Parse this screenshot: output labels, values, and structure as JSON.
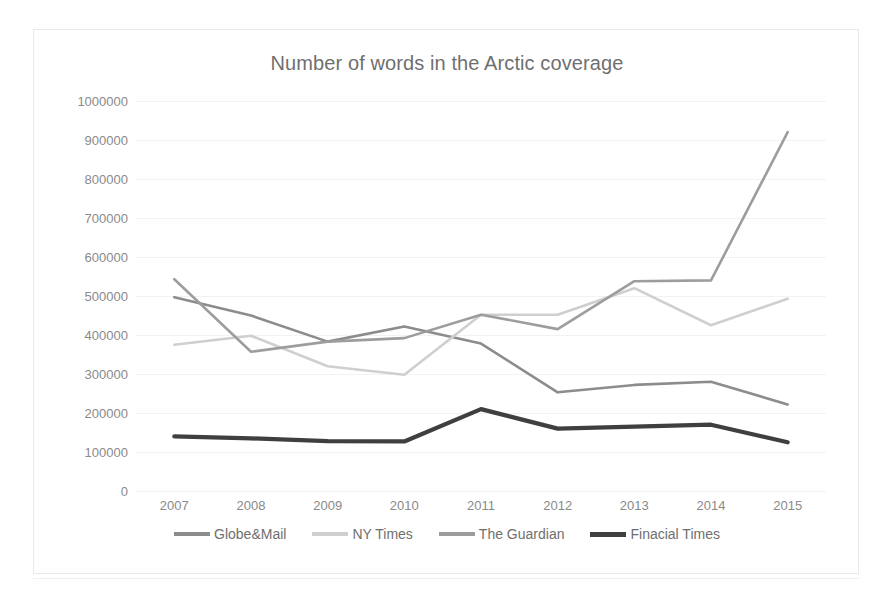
{
  "chart_data": {
    "type": "line",
    "title": "Number of words in the Arctic coverage",
    "xlabel": "",
    "ylabel": "",
    "grid": true,
    "legend_position": "bottom",
    "categories": [
      "2007",
      "2008",
      "2009",
      "2010",
      "2011",
      "2012",
      "2013",
      "2014",
      "2015"
    ],
    "ylim": [
      0,
      1000000
    ],
    "ytick_labels": [
      "1000000",
      "900000",
      "800000",
      "700000",
      "600000",
      "500000",
      "400000",
      "300000",
      "200000",
      "100000",
      "0"
    ],
    "ytick_values": [
      1000000,
      900000,
      800000,
      700000,
      600000,
      500000,
      400000,
      300000,
      200000,
      100000,
      0
    ],
    "series": [
      {
        "name": "Globe&Mail",
        "color": "#8c8c8c",
        "values": [
          497000,
          450000,
          383000,
          422000,
          378000,
          253000,
          272000,
          280000,
          222000
        ]
      },
      {
        "name": "NY Times",
        "color": "#cfcfcf",
        "values": [
          375000,
          398000,
          320000,
          298000,
          452000,
          452000,
          520000,
          425000,
          493000
        ]
      },
      {
        "name": "The Guardian",
        "color": "#9d9d9d",
        "values": [
          543000,
          357000,
          383000,
          392000,
          452000,
          415000,
          538000,
          540000,
          920000
        ]
      },
      {
        "name": "Finacial Times",
        "color": "#3f3f3f",
        "values": [
          140000,
          135000,
          128000,
          127000,
          210000,
          160000,
          165000,
          170000,
          125000
        ]
      }
    ]
  }
}
